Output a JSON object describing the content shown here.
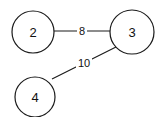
{
  "diagram": {
    "type": "weighted-graph",
    "nodes": [
      {
        "id": "2",
        "label": "2",
        "cx": 33,
        "cy": 32,
        "r": 21
      },
      {
        "id": "3",
        "label": "3",
        "cx": 132,
        "cy": 32,
        "r": 22
      },
      {
        "id": "4",
        "label": "4",
        "cx": 35,
        "cy": 97,
        "r": 20
      }
    ],
    "edges": [
      {
        "from": "2",
        "to": "3",
        "weight": "8"
      },
      {
        "from": "3",
        "to": "4",
        "weight": "10"
      }
    ]
  }
}
